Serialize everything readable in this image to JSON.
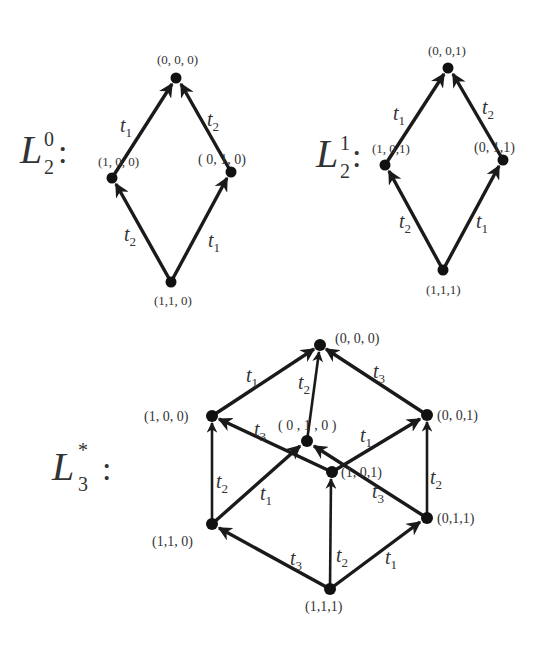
{
  "diagrams": [
    {
      "id": "L2_0",
      "title": {
        "base": "L",
        "sub": "2",
        "sup": "0",
        "colon": ":"
      },
      "nodes": [
        {
          "id": "000",
          "label": "(0, 0, 0)",
          "x": 176,
          "y": 78
        },
        {
          "id": "100",
          "label": "(1, 0, 0)",
          "x": 112,
          "y": 178
        },
        {
          "id": "010",
          "label": "( 0, 1, 0)",
          "x": 231,
          "y": 172
        },
        {
          "id": "110",
          "label": "(1,1, 0)",
          "x": 171,
          "y": 282
        }
      ],
      "edges": [
        {
          "from": "100",
          "to": "000",
          "label": "t",
          "sub": "1"
        },
        {
          "from": "010",
          "to": "000",
          "label": "t",
          "sub": "2"
        },
        {
          "from": "110",
          "to": "100",
          "label": "t",
          "sub": "2"
        },
        {
          "from": "110",
          "to": "010",
          "label": "t",
          "sub": "1"
        }
      ]
    },
    {
      "id": "L2_1",
      "title": {
        "base": "L",
        "sub": "2",
        "sup": "1",
        "colon": ":"
      },
      "nodes": [
        {
          "id": "001",
          "label": "(0, 0,1)",
          "x": 448,
          "y": 68
        },
        {
          "id": "101",
          "label": "(1, 0,1)",
          "x": 385,
          "y": 165
        },
        {
          "id": "011",
          "label": "(0, 1,1)",
          "x": 503,
          "y": 160
        },
        {
          "id": "111",
          "label": "(1,1,1)",
          "x": 443,
          "y": 270
        }
      ],
      "edges": [
        {
          "from": "101",
          "to": "001",
          "label": "t",
          "sub": "1"
        },
        {
          "from": "011",
          "to": "001",
          "label": "t",
          "sub": "2"
        },
        {
          "from": "111",
          "to": "101",
          "label": "t",
          "sub": "2"
        },
        {
          "from": "111",
          "to": "011",
          "label": "t",
          "sub": "1"
        }
      ]
    },
    {
      "id": "L3_star",
      "title": {
        "base": "L",
        "sub": "3",
        "sup": "*",
        "colon": ":"
      },
      "nodes": [
        {
          "id": "000",
          "label": "(0, 0, 0)",
          "x": 320,
          "y": 345
        },
        {
          "id": "100",
          "label": "(1, 0, 0)",
          "x": 212,
          "y": 416
        },
        {
          "id": "010",
          "label": "( 0 , 1 , 0 )",
          "x": 307,
          "y": 441
        },
        {
          "id": "001",
          "label": "(0, 0,1)",
          "x": 427,
          "y": 415
        },
        {
          "id": "101",
          "label": "(1, 0,1)",
          "x": 332,
          "y": 472
        },
        {
          "id": "110",
          "label": "(1,1, 0)",
          "x": 212,
          "y": 524
        },
        {
          "id": "011",
          "label": "(0,1,1)",
          "x": 427,
          "y": 518
        },
        {
          "id": "111",
          "label": "(1,1,1)",
          "x": 330,
          "y": 589
        }
      ],
      "edges": [
        {
          "from": "100",
          "to": "000",
          "label": "t",
          "sub": "1"
        },
        {
          "from": "010",
          "to": "000",
          "label": "t",
          "sub": "2"
        },
        {
          "from": "001",
          "to": "000",
          "label": "t",
          "sub": "3"
        },
        {
          "from": "101",
          "to": "100",
          "label": "t",
          "sub": "3"
        },
        {
          "from": "110",
          "to": "100",
          "label": "t",
          "sub": "2"
        },
        {
          "from": "110",
          "to": "010",
          "label": "t",
          "sub": "1"
        },
        {
          "from": "011",
          "to": "010",
          "label": "t",
          "sub": "3"
        },
        {
          "from": "101",
          "to": "001",
          "label": "t",
          "sub": "1"
        },
        {
          "from": "011",
          "to": "001",
          "label": "t",
          "sub": "2"
        },
        {
          "from": "111",
          "to": "110",
          "label": "t",
          "sub": "3"
        },
        {
          "from": "111",
          "to": "101",
          "label": "t",
          "sub": "2"
        },
        {
          "from": "111",
          "to": "011",
          "label": "t",
          "sub": "1"
        }
      ]
    }
  ]
}
